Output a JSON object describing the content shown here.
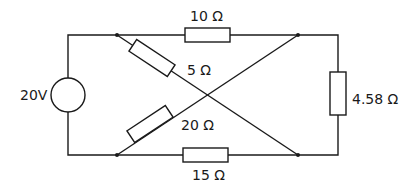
{
  "diagram": {
    "type": "circuit",
    "source": {
      "label": "20V"
    },
    "resistors": [
      {
        "id": "r-top",
        "label": "10 Ω"
      },
      {
        "id": "r-diag-down",
        "label": "5 Ω"
      },
      {
        "id": "r-diag-up",
        "label": "20 Ω"
      },
      {
        "id": "r-bottom",
        "label": "15 Ω"
      },
      {
        "id": "r-load",
        "label": "4.58 Ω"
      }
    ],
    "colors": {
      "line": "#1a1a1a",
      "background": "#ffffff"
    }
  }
}
